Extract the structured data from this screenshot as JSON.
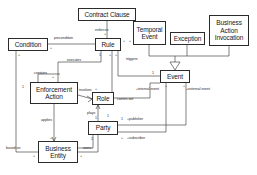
{
  "diagram": {
    "type": "uml-class-diagram",
    "classes": [
      {
        "id": "contract-clause",
        "label": "Contract Clause",
        "x": 78,
        "y": 8,
        "w": 58,
        "h": 13
      },
      {
        "id": "condition",
        "label": "Condition",
        "x": 8,
        "y": 38,
        "w": 40,
        "h": 13
      },
      {
        "id": "rule",
        "label": "Rule",
        "x": 95,
        "y": 38,
        "w": 26,
        "h": 13
      },
      {
        "id": "temporal-event",
        "label": "Temporal Event",
        "x": 133,
        "y": 21,
        "w": 33,
        "h": 24
      },
      {
        "id": "exception",
        "label": "Exception",
        "x": 170,
        "y": 32,
        "w": 35,
        "h": 13
      },
      {
        "id": "business-action-invocation",
        "label": "Business Action Invocation",
        "x": 209,
        "y": 15,
        "w": 40,
        "h": 31
      },
      {
        "id": "event",
        "label": "Event",
        "x": 160,
        "y": 70,
        "w": 30,
        "h": 13
      },
      {
        "id": "enforcement-action",
        "label": "Enforcement Action",
        "x": 30,
        "y": 82,
        "w": 48,
        "h": 22
      },
      {
        "id": "role",
        "label": "Role",
        "x": 92,
        "y": 92,
        "w": 22,
        "h": 13
      },
      {
        "id": "party",
        "label": "Party",
        "x": 88,
        "y": 121,
        "w": 30,
        "h": 14
      },
      {
        "id": "business-entity",
        "label": "Business Entity",
        "x": 38,
        "y": 141,
        "w": 40,
        "h": 22
      }
    ],
    "edge_labels": [
      {
        "id": "enforces",
        "text": "enforces",
        "x": 95,
        "y": 28
      },
      {
        "id": "precondition",
        "text": "precondition",
        "x": 54,
        "y": 36
      },
      {
        "id": "executes",
        "text": "executes",
        "x": 67,
        "y": 58
      },
      {
        "id": "triggers",
        "text": "triggers",
        "x": 126,
        "y": 57
      },
      {
        "id": "involves",
        "text": "involves",
        "x": 79,
        "y": 88
      },
      {
        "id": "carries-out",
        "text": "carries out",
        "x": 117,
        "y": 97
      },
      {
        "id": "applies",
        "text": "applies",
        "x": 41,
        "y": 118
      },
      {
        "id": "plays",
        "text": "plays",
        "x": 87,
        "y": 111
      },
      {
        "id": "based-on",
        "text": "based on",
        "x": 18,
        "y": 146
      },
      {
        "id": "owns",
        "text": "owns",
        "x": 85,
        "y": 147
      },
      {
        "id": "contains",
        "text": "contains",
        "x": 36,
        "y": 75
      },
      {
        "id": "publisher",
        "text": "+publisher",
        "x": 127,
        "y": 117
      },
      {
        "id": "subscriber",
        "text": "+subscriber",
        "x": 127,
        "y": 137
      },
      {
        "id": "internal-event",
        "text": "+internal event",
        "x": 139,
        "y": 88
      },
      {
        "id": "external-event",
        "text": "+external event",
        "x": 186,
        "y": 88
      }
    ],
    "multiplicities": [
      {
        "id": "m-clause-rule-top",
        "text": "+",
        "x": 104,
        "y": 33
      },
      {
        "id": "m-cond-right",
        "text": "+",
        "x": 50,
        "y": 47
      },
      {
        "id": "m-cond-below",
        "text": "+",
        "x": 19,
        "y": 55
      },
      {
        "id": "m-rule-right",
        "text": "+",
        "x": 123,
        "y": 40
      },
      {
        "id": "m-rule-right2",
        "text": "+",
        "x": 130,
        "y": 40
      },
      {
        "id": "m-rule-b1",
        "text": "1",
        "x": 100,
        "y": 54
      },
      {
        "id": "m-rule-b2",
        "text": "+",
        "x": 110,
        "y": 54
      },
      {
        "id": "m-rule-b3",
        "text": "+",
        "x": 115,
        "y": 54
      },
      {
        "id": "m-ea-left",
        "text": "1",
        "x": 23,
        "y": 86
      },
      {
        "id": "m-ea-top",
        "text": "+",
        "x": 52,
        "y": 76
      },
      {
        "id": "m-role-top",
        "text": "+",
        "x": 95,
        "y": 88
      },
      {
        "id": "m-event-left",
        "text": "1",
        "x": 153,
        "y": 72
      },
      {
        "id": "m-event-b1",
        "text": "+",
        "x": 166,
        "y": 85
      },
      {
        "id": "m-event-b2",
        "text": "+",
        "x": 184,
        "y": 85
      },
      {
        "id": "m-party-top",
        "text": "1",
        "x": 108,
        "y": 115
      },
      {
        "id": "m-party-right",
        "text": "1",
        "x": 120,
        "y": 118
      },
      {
        "id": "m-party-sub",
        "text": "+",
        "x": 120,
        "y": 137
      },
      {
        "id": "m-party-bottom",
        "text": "1",
        "x": 92,
        "y": 138
      },
      {
        "id": "m-be-left",
        "text": "+",
        "x": 34,
        "y": 155
      },
      {
        "id": "m-be-right",
        "text": "+",
        "x": 81,
        "y": 155
      },
      {
        "id": "m-be-top",
        "text": "+",
        "x": 50,
        "y": 137
      },
      {
        "id": "m-plays-1",
        "text": "1",
        "x": 95,
        "y": 117
      }
    ],
    "colors": {
      "stroke": "#2b2b2b",
      "background": "#ffffff",
      "text": "#171717"
    }
  }
}
